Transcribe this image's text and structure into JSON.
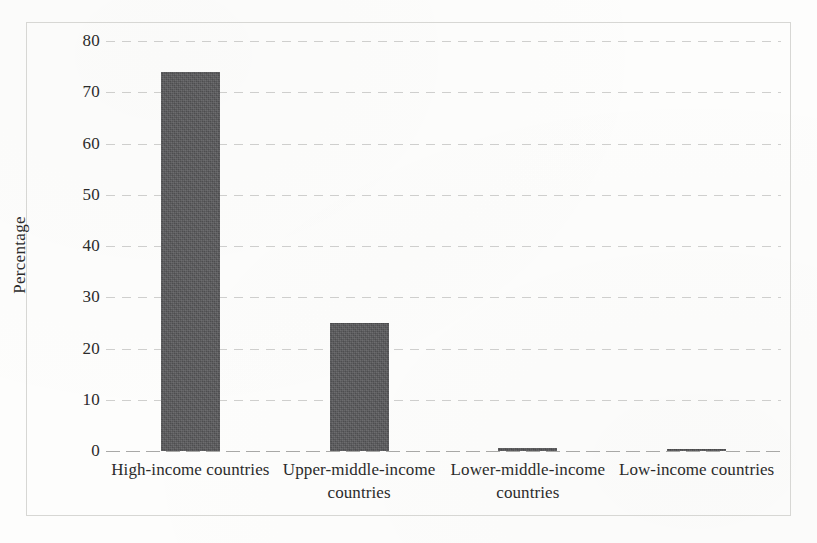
{
  "chart_data": {
    "type": "bar",
    "title": "",
    "subtitle": "",
    "xlabel": "",
    "ylabel": "Percentage",
    "categories": [
      "High-income countries",
      "Upper-middle-income countries",
      "Lower-middle-income countries",
      "Low-income countries"
    ],
    "values": [
      74,
      25,
      0.5,
      0.4
    ],
    "ylim": [
      0,
      80
    ],
    "yticks": [
      0,
      10,
      20,
      30,
      40,
      50,
      60,
      70,
      80
    ],
    "ytick_labels": [
      "0",
      "10",
      "20",
      "30",
      "40",
      "50",
      "60",
      "70",
      "80"
    ],
    "grid": true,
    "grid_axis": "y",
    "legend": false,
    "legend_position": "none",
    "bar_color": "#58585a",
    "grid_color": "#aaaaa8",
    "border_color": "#d7d7d4",
    "background_color": "#fdfdfc",
    "text_color": "#2b2b2b"
  }
}
